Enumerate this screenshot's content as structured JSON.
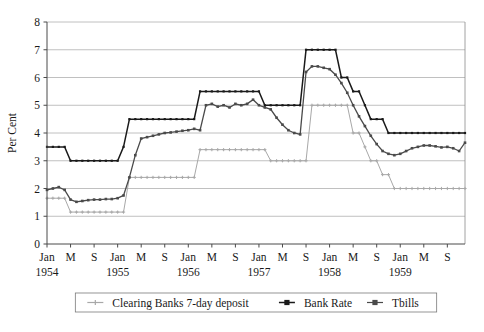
{
  "chart_data": {
    "type": "line",
    "title": "",
    "xlabel": "",
    "ylabel": "Per Cent",
    "ylim": [
      0,
      8
    ],
    "ytick_values": [
      0,
      1,
      2,
      3,
      4,
      5,
      6,
      7,
      8
    ],
    "ytick_labels": [
      "0",
      "1",
      "2",
      "3",
      "4",
      "5",
      "6",
      "7",
      "8"
    ],
    "grid": "horizontal",
    "legend_position": "bottom",
    "x_start": "1954-01",
    "x_end": "1959-12",
    "x_tick_labels": [
      "Jan",
      "M",
      "S",
      "Jan",
      "M",
      "S",
      "Jan",
      "M",
      "S",
      "Jan",
      "M",
      "S",
      "Jan",
      "M",
      "S",
      "Jan",
      "M",
      "S"
    ],
    "x_year_labels": [
      "1954",
      "",
      "",
      "1955",
      "",
      "",
      "1956",
      "",
      "",
      "1957",
      "",
      "",
      "1958",
      "",
      "",
      "1959",
      "",
      ""
    ],
    "x_months": [
      "1954-01",
      "1954-02",
      "1954-03",
      "1954-04",
      "1954-05",
      "1954-06",
      "1954-07",
      "1954-08",
      "1954-09",
      "1954-10",
      "1954-11",
      "1954-12",
      "1955-01",
      "1955-02",
      "1955-03",
      "1955-04",
      "1955-05",
      "1955-06",
      "1955-07",
      "1955-08",
      "1955-09",
      "1955-10",
      "1955-11",
      "1955-12",
      "1956-01",
      "1956-02",
      "1956-03",
      "1956-04",
      "1956-05",
      "1956-06",
      "1956-07",
      "1956-08",
      "1956-09",
      "1956-10",
      "1956-11",
      "1956-12",
      "1957-01",
      "1957-02",
      "1957-03",
      "1957-04",
      "1957-05",
      "1957-06",
      "1957-07",
      "1957-08",
      "1957-09",
      "1957-10",
      "1957-11",
      "1957-12",
      "1958-01",
      "1958-02",
      "1958-03",
      "1958-04",
      "1958-05",
      "1958-06",
      "1958-07",
      "1958-08",
      "1958-09",
      "1958-10",
      "1958-11",
      "1958-12",
      "1959-01",
      "1959-02",
      "1959-03",
      "1959-04",
      "1959-05",
      "1959-06",
      "1959-07",
      "1959-08",
      "1959-09",
      "1959-10",
      "1959-11",
      "1959-12"
    ],
    "series": [
      {
        "name": "Clearing Banks 7-day deposit",
        "color": "#a8a8a8",
        "marker": "plus",
        "values": [
          1.65,
          1.65,
          1.65,
          1.65,
          1.15,
          1.15,
          1.15,
          1.15,
          1.15,
          1.15,
          1.15,
          1.15,
          1.15,
          1.15,
          2.4,
          2.4,
          2.4,
          2.4,
          2.4,
          2.4,
          2.4,
          2.4,
          2.4,
          2.4,
          2.4,
          2.4,
          3.4,
          3.4,
          3.4,
          3.4,
          3.4,
          3.4,
          3.4,
          3.4,
          3.4,
          3.4,
          3.4,
          3.4,
          3.0,
          3.0,
          3.0,
          3.0,
          3.0,
          3.0,
          3.0,
          5.0,
          5.0,
          5.0,
          5.0,
          5.0,
          5.0,
          5.0,
          4.0,
          4.0,
          3.5,
          3.0,
          3.0,
          2.5,
          2.5,
          2.0,
          2.0,
          2.0,
          2.0,
          2.0,
          2.0,
          2.0,
          2.0,
          2.0,
          2.0,
          2.0,
          2.0,
          2.0
        ]
      },
      {
        "name": "Bank Rate",
        "color": "#1a1a1a",
        "marker": "square",
        "values": [
          3.5,
          3.5,
          3.5,
          3.5,
          3.0,
          3.0,
          3.0,
          3.0,
          3.0,
          3.0,
          3.0,
          3.0,
          3.0,
          3.5,
          4.5,
          4.5,
          4.5,
          4.5,
          4.5,
          4.5,
          4.5,
          4.5,
          4.5,
          4.5,
          4.5,
          4.5,
          5.5,
          5.5,
          5.5,
          5.5,
          5.5,
          5.5,
          5.5,
          5.5,
          5.5,
          5.5,
          5.5,
          5.0,
          5.0,
          5.0,
          5.0,
          5.0,
          5.0,
          5.0,
          7.0,
          7.0,
          7.0,
          7.0,
          7.0,
          7.0,
          6.0,
          6.0,
          5.5,
          5.5,
          5.0,
          4.5,
          4.5,
          4.5,
          4.0,
          4.0,
          4.0,
          4.0,
          4.0,
          4.0,
          4.0,
          4.0,
          4.0,
          4.0,
          4.0,
          4.0,
          4.0,
          4.0
        ]
      },
      {
        "name": "Tbills",
        "color": "#4a4a4a",
        "marker": "square",
        "values": [
          1.95,
          2.0,
          2.05,
          1.95,
          1.6,
          1.52,
          1.55,
          1.58,
          1.6,
          1.6,
          1.62,
          1.62,
          1.65,
          1.75,
          2.4,
          3.2,
          3.8,
          3.85,
          3.9,
          3.95,
          4.0,
          4.02,
          4.05,
          4.08,
          4.1,
          4.15,
          4.1,
          5.0,
          5.05,
          4.95,
          5.0,
          4.92,
          5.05,
          5.0,
          5.05,
          5.2,
          5.0,
          4.92,
          4.85,
          4.55,
          4.3,
          4.1,
          4.0,
          3.95,
          6.2,
          6.4,
          6.4,
          6.35,
          6.3,
          6.1,
          5.8,
          5.45,
          5.0,
          4.6,
          4.25,
          3.9,
          3.6,
          3.35,
          3.25,
          3.2,
          3.25,
          3.35,
          3.45,
          3.5,
          3.55,
          3.55,
          3.52,
          3.48,
          3.5,
          3.45,
          3.35,
          3.65
        ]
      }
    ]
  },
  "legend": {
    "items": [
      {
        "label": "Clearing Banks 7-day deposit"
      },
      {
        "label": "Bank Rate"
      },
      {
        "label": "Tbills"
      }
    ]
  },
  "axes": {
    "y_title": "Per Cent"
  }
}
